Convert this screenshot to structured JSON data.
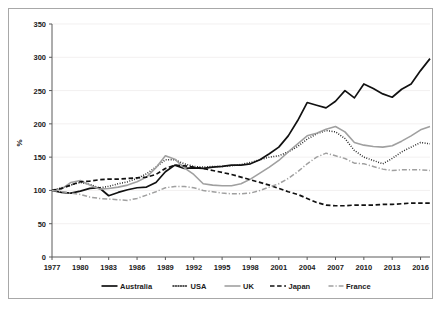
{
  "chart_data": {
    "type": "line",
    "title": "",
    "xlabel": "",
    "ylabel": "%",
    "xlim": [
      1977,
      2017
    ],
    "ylim": [
      0,
      350
    ],
    "ytick_step": 50,
    "yticks": [
      0,
      50,
      100,
      150,
      200,
      250,
      300,
      350
    ],
    "xticks": [
      1977,
      1980,
      1983,
      1986,
      1989,
      1992,
      1995,
      1998,
      2001,
      2004,
      2007,
      2010,
      2013,
      2016
    ],
    "grid": "horizontal-faint",
    "legend_position": "bottom",
    "x": [
      1977,
      1978,
      1979,
      1980,
      1981,
      1982,
      1983,
      1984,
      1985,
      1986,
      1987,
      1988,
      1989,
      1990,
      1991,
      1992,
      1993,
      1994,
      1995,
      1996,
      1997,
      1998,
      1999,
      2000,
      2001,
      2002,
      2003,
      2004,
      2005,
      2006,
      2007,
      2008,
      2009,
      2010,
      2011,
      2012,
      2013,
      2014,
      2015,
      2016,
      2017
    ],
    "series": [
      {
        "name": "Australia",
        "color": "#111111",
        "style": "solid",
        "width": 1.7,
        "values": [
          100,
          97,
          96,
          99,
          103,
          104,
          92,
          97,
          101,
          104,
          105,
          112,
          128,
          138,
          133,
          134,
          133,
          135,
          136,
          138,
          138,
          140,
          146,
          155,
          165,
          182,
          205,
          232,
          228,
          224,
          234,
          250,
          239,
          260,
          253,
          245,
          240,
          252,
          260,
          280,
          298
        ]
      },
      {
        "name": "USA",
        "color": "#1a1a1a",
        "style": "dotted",
        "width": 1.5,
        "values": [
          100,
          104,
          108,
          112,
          109,
          104,
          106,
          110,
          113,
          118,
          125,
          135,
          146,
          146,
          140,
          136,
          135,
          136,
          136,
          137,
          139,
          142,
          146,
          150,
          152,
          158,
          166,
          177,
          185,
          190,
          188,
          178,
          160,
          150,
          145,
          140,
          148,
          158,
          165,
          172,
          170
        ]
      },
      {
        "name": "UK",
        "color": "#a0a0a0",
        "style": "solid",
        "width": 1.6,
        "values": [
          100,
          102,
          112,
          115,
          108,
          102,
          103,
          105,
          108,
          113,
          120,
          134,
          152,
          147,
          134,
          124,
          110,
          108,
          107,
          107,
          110,
          117,
          126,
          135,
          145,
          158,
          170,
          182,
          186,
          192,
          196,
          188,
          172,
          168,
          166,
          165,
          167,
          174,
          182,
          191,
          196
        ]
      },
      {
        "name": "Japan",
        "color": "#111111",
        "style": "dashed",
        "width": 1.7,
        "values": [
          100,
          103,
          108,
          113,
          114,
          116,
          117,
          117,
          118,
          119,
          120,
          124,
          133,
          138,
          137,
          135,
          133,
          130,
          127,
          124,
          120,
          116,
          112,
          108,
          103,
          98,
          94,
          88,
          82,
          78,
          77,
          77,
          78,
          78,
          78,
          79,
          79,
          80,
          81,
          81,
          81
        ]
      },
      {
        "name": "France",
        "color": "#a0a0a0",
        "style": "dashdot",
        "width": 1.5,
        "values": [
          100,
          98,
          96,
          94,
          90,
          88,
          87,
          86,
          85,
          88,
          93,
          98,
          104,
          106,
          106,
          104,
          100,
          98,
          96,
          95,
          95,
          96,
          100,
          105,
          110,
          118,
          128,
          140,
          150,
          156,
          152,
          148,
          141,
          140,
          136,
          132,
          130,
          131,
          131,
          131,
          130
        ]
      }
    ]
  },
  "legend": {
    "items": [
      {
        "label": "Australia"
      },
      {
        "label": "USA"
      },
      {
        "label": "UK"
      },
      {
        "label": "Japan"
      },
      {
        "label": "France"
      }
    ]
  },
  "axis": {
    "y_title": "%"
  }
}
